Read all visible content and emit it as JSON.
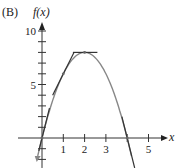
{
  "panel_label": "(B)",
  "chart_data": {
    "type": "line",
    "title": "",
    "xlabel": "x",
    "ylabel": "f(x)",
    "function": "f(x) = -2x^2 + 8x",
    "x_ticks": [
      1,
      2,
      3,
      4,
      5
    ],
    "x_tick_labels": [
      "1",
      "2",
      "3",
      "",
      "5"
    ],
    "y_tick_labels": [
      {
        "value": 5,
        "label": "5"
      },
      {
        "value": 10,
        "label": "10"
      }
    ],
    "y_minor_tick_step": 1,
    "xlim": [
      -0.3,
      5.8
    ],
    "ylim": [
      -2.8,
      10.6
    ],
    "grid": false,
    "legend": null,
    "series": [
      {
        "name": "f(x)",
        "x": [
          -0.15,
          0,
          0.5,
          1,
          1.5,
          2,
          2.5,
          3,
          3.5,
          4,
          4.15
        ],
        "y": [
          -1.25,
          0,
          3.5,
          6,
          7.5,
          8,
          7.5,
          6,
          3.5,
          0,
          -1.25
        ],
        "color": "#888888"
      }
    ],
    "tangent_lines": [
      {
        "at_x": 0,
        "point": [
          0,
          0
        ],
        "slope": 8
      },
      {
        "at_x": 1,
        "point": [
          1,
          6
        ],
        "slope": 4
      },
      {
        "at_x": 2,
        "point": [
          2,
          8
        ],
        "slope": 0
      },
      {
        "at_x": 4,
        "point": [
          4,
          0
        ],
        "slope": -8
      }
    ],
    "tangent_color": "#333333"
  }
}
